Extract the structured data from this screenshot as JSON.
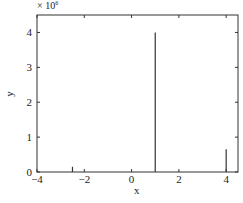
{
  "chart_data": {
    "type": "stem",
    "title": "",
    "xlabel": "x",
    "ylabel": "y",
    "y_multiplier": "× 10^6",
    "xlim": [
      -4,
      4.5
    ],
    "ylim": [
      0,
      4.5
    ],
    "xticks": [
      -4,
      -2,
      0,
      2,
      4
    ],
    "yticks": [
      0,
      1,
      2,
      3,
      4
    ],
    "grid": false,
    "series": [
      {
        "name": "y",
        "x": [
          -2.5,
          1,
          4
        ],
        "values": [
          0.15,
          4.0,
          0.65
        ]
      }
    ]
  },
  "labels": {
    "multiplier": "× 10",
    "exponent": "6",
    "xlabel": "x",
    "ylabel": "y"
  }
}
